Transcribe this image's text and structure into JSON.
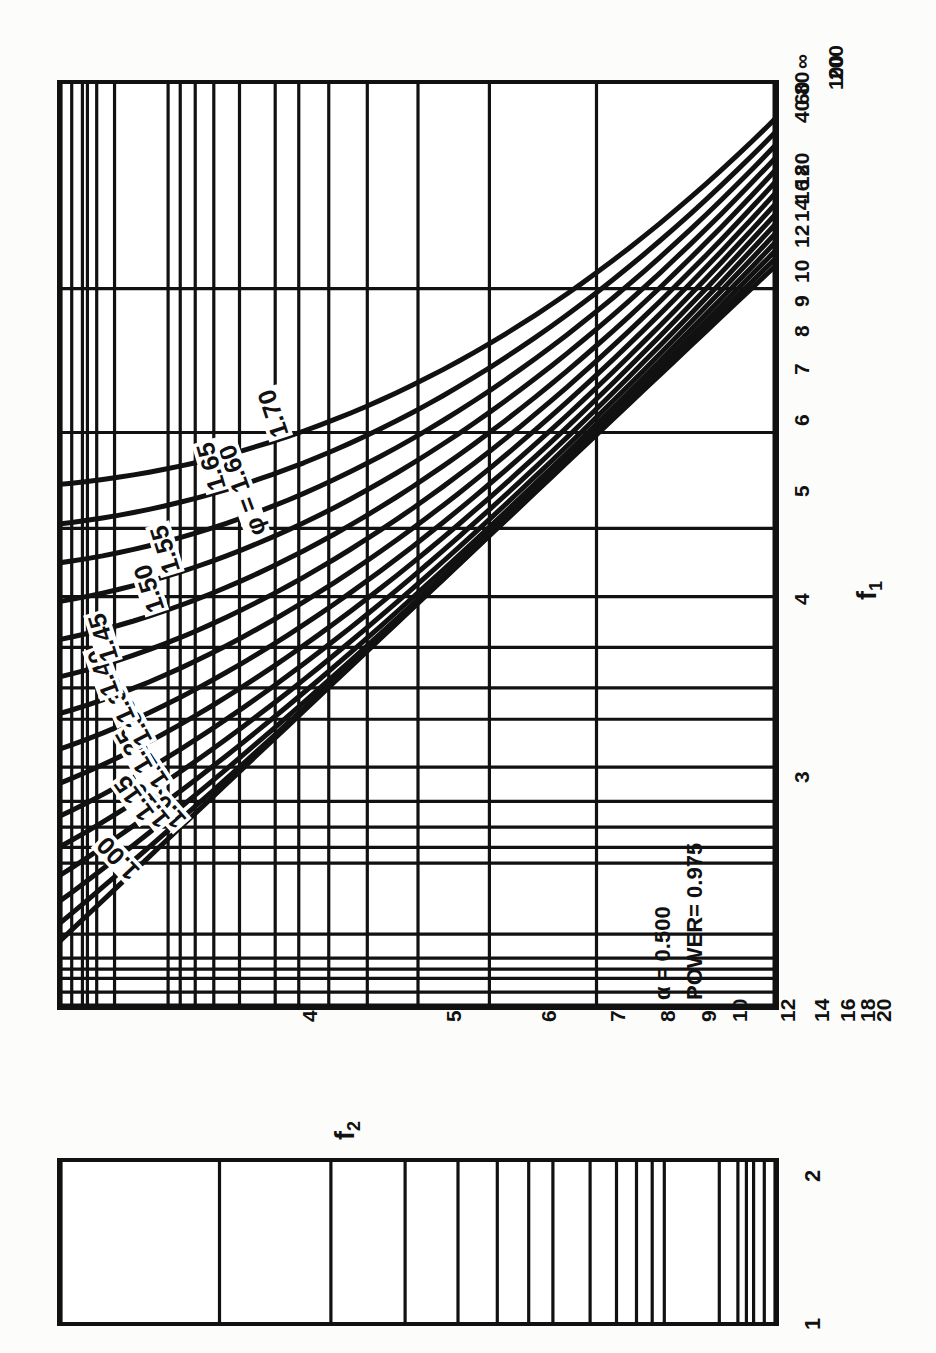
{
  "figure": {
    "kind": "power-curve-nomogram",
    "orientation": "rotated-90-ccw",
    "annotation_alpha": "α  = 0.500",
    "annotation_power": "POWER= 0.975",
    "phi_label_prefix": "φ = ",
    "axis_f1_title": "f",
    "axis_f1_sub": "1",
    "axis_f2_title": "f",
    "axis_f2_sub": "2",
    "bottom_panel_left_label": "1",
    "bottom_panel_right_label": "2",
    "ink_color": "#111111",
    "paper_color": "#fcfcfa"
  },
  "chart_data": {
    "type": "line",
    "title": "",
    "subtitle": "",
    "xlabel": "f₂",
    "ylabel": "f₁",
    "grid": true,
    "legend": "none",
    "annotations": [
      {
        "text": "α  = 0.500",
        "x_axis_value": 4.6,
        "y_axis_value": 4.4
      },
      {
        "text": "POWER= 0.975",
        "x_axis_value": 4.6,
        "y_axis_value": 4.1
      },
      {
        "text": "φ = 1.60",
        "x_axis_value": 10.0,
        "y_axis_value": 4.6
      }
    ],
    "x_axis": {
      "name": "f2",
      "scale": "reciprocal (1/f2, ∞ at left)",
      "ticks": [
        "∞",
        "200",
        "100",
        "80",
        "60",
        "40",
        "20",
        "18",
        "16",
        "14",
        "12",
        "10",
        "9",
        "8",
        "7",
        "6",
        "5",
        "4"
      ],
      "tick_values": [
        null,
        200,
        100,
        80,
        60,
        40,
        20,
        18,
        16,
        14,
        12,
        10,
        9,
        8,
        7,
        6,
        5,
        4
      ],
      "tick_positions_frac": [
        0.0,
        0.015,
        0.03,
        0.04,
        0.052,
        0.078,
        0.155,
        0.172,
        0.194,
        0.222,
        0.259,
        0.311,
        0.345,
        0.389,
        0.444,
        0.518,
        0.622,
        0.778
      ]
    },
    "y_axis": {
      "name": "f1",
      "scale": "reciprocal (3 at bottom, ∞ at top)",
      "ticks": [
        "3",
        "4",
        "5",
        "6",
        "7",
        "8",
        "9",
        "10",
        "12",
        "14",
        "16",
        "18",
        "20",
        "40",
        "60",
        "80",
        "100",
        "200",
        "∞"
      ],
      "tick_values": [
        3,
        4,
        5,
        6,
        7,
        8,
        9,
        10,
        12,
        14,
        16,
        18,
        20,
        40,
        60,
        80,
        100,
        200,
        null
      ],
      "tick_positions_frac": [
        0.0,
        0.25,
        0.4,
        0.5,
        0.571,
        0.625,
        0.667,
        0.7,
        0.75,
        0.786,
        0.812,
        0.833,
        0.85,
        0.925,
        0.95,
        0.963,
        0.97,
        0.985,
        1.0
      ]
    },
    "contours": {
      "variable": "φ",
      "levels": [
        1.0,
        1.05,
        1.1,
        1.15,
        1.2,
        1.25,
        1.3,
        1.35,
        1.4,
        1.45,
        1.5,
        1.55,
        1.6,
        1.65,
        1.7
      ],
      "labels": [
        "1.00",
        "1.05",
        "1.10",
        "1.15",
        "1.20",
        "1.25",
        "1.30",
        "1.35",
        "1.40",
        "1.45",
        "1.50",
        "1.55",
        "1.60",
        "1.65",
        "1.70"
      ]
    },
    "bottom_panel": {
      "left_tick": "1",
      "right_tick": "2",
      "gridline_positions_frac": [
        0.0,
        0.015,
        0.03,
        0.04,
        0.052,
        0.078,
        0.155,
        0.172,
        0.194,
        0.222,
        0.259,
        0.311,
        0.345,
        0.389,
        0.444,
        0.518,
        0.622,
        0.778,
        1.0
      ]
    }
  }
}
